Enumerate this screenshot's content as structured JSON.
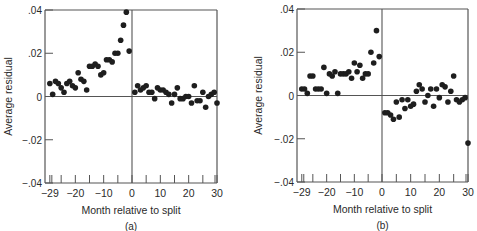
{
  "figure": {
    "panels": [
      {
        "label": "(a)"
      },
      {
        "label": "(b)"
      }
    ]
  },
  "chart_data": [
    {
      "type": "scatter",
      "panel_label": "(a)",
      "title": "",
      "xlabel": "Month relative to split",
      "ylabel": "Average residual",
      "xlim": [
        -30,
        30
      ],
      "ylim": [
        -0.04,
        0.04
      ],
      "xticks": [
        -29,
        -20,
        -10,
        0,
        10,
        20,
        30
      ],
      "xtick_labels": [
        "−29",
        "−20",
        "−10",
        "0",
        "10",
        "20",
        "30"
      ],
      "yticks": [
        0.04,
        0.02,
        0,
        -0.02,
        -0.04
      ],
      "ytick_labels": [
        ".04",
        ".02",
        "0",
        "−.02",
        "−.04"
      ],
      "minor_xticks_every": 5,
      "grid": false,
      "reference_lines": {
        "x": 0,
        "y": 0
      },
      "x": [
        -29,
        -28,
        -27,
        -26,
        -25,
        -24,
        -23,
        -22,
        -21,
        -20,
        -19,
        -18,
        -17,
        -16,
        -15,
        -14,
        -13,
        -12,
        -11,
        -10,
        -9,
        -8,
        -7,
        -6,
        -5,
        -4,
        -3,
        -2,
        -1,
        1,
        2,
        3,
        4,
        5,
        6,
        7,
        8,
        9,
        10,
        11,
        12,
        13,
        14,
        15,
        16,
        17,
        18,
        19,
        20,
        21,
        22,
        23,
        24,
        25,
        26,
        27,
        28,
        29,
        30
      ],
      "values": [
        0.006,
        0.001,
        0.007,
        0.006,
        0.004,
        0.002,
        0.006,
        0.007,
        0.005,
        0.004,
        0.011,
        0.008,
        0.007,
        0.003,
        0.014,
        0.014,
        0.015,
        0.014,
        0.01,
        0.011,
        0.017,
        0.017,
        0.016,
        0.02,
        0.02,
        0.026,
        0.033,
        0.039,
        0.021,
        0.002,
        0.005,
        0.003,
        0.004,
        0.005,
        0.002,
        0.002,
        -0.001,
        0.004,
        0.003,
        0.003,
        0.002,
        0.001,
        -0.003,
        0.001,
        0.004,
        -0.001,
        -0.001,
        0.0,
        0.0,
        -0.003,
        0.005,
        -0.002,
        -0.002,
        0.002,
        -0.005,
        0.0,
        0.001,
        0.002,
        -0.003
      ]
    },
    {
      "type": "scatter",
      "panel_label": "(b)",
      "title": "",
      "xlabel": "Month relative to split",
      "ylabel": "Average residual",
      "xlim": [
        -30,
        30
      ],
      "ylim": [
        -0.04,
        0.04
      ],
      "xticks": [
        -29,
        -20,
        -10,
        0,
        10,
        20,
        30
      ],
      "xtick_labels": [
        "−29",
        "−20",
        "−10",
        "0",
        "10",
        "20",
        "30"
      ],
      "yticks": [
        0.04,
        0.02,
        0,
        -0.02,
        -0.04
      ],
      "ytick_labels": [
        ".04",
        ".02",
        "0",
        "−.02",
        "−.04"
      ],
      "minor_xticks_every": 5,
      "grid": false,
      "reference_lines": {
        "x": 0,
        "y": 0
      },
      "x": [
        -29,
        -28,
        -27,
        -26,
        -25,
        -24,
        -23,
        -22,
        -21,
        -20,
        -19,
        -18,
        -17,
        -16,
        -15,
        -14,
        -13,
        -12,
        -11,
        -10,
        -9,
        -8,
        -7,
        -6,
        -5,
        -4,
        -3,
        -2,
        -1,
        1,
        2,
        3,
        4,
        5,
        6,
        7,
        8,
        9,
        10,
        11,
        12,
        13,
        14,
        15,
        16,
        17,
        18,
        19,
        20,
        21,
        22,
        23,
        24,
        25,
        26,
        27,
        28,
        29,
        30
      ],
      "values": [
        0.003,
        0.003,
        0.001,
        0.009,
        0.009,
        0.003,
        0.003,
        0.003,
        0.013,
        0.001,
        0.01,
        0.009,
        0.011,
        0.001,
        0.01,
        0.01,
        0.01,
        0.011,
        0.008,
        0.015,
        0.011,
        0.014,
        0.008,
        0.01,
        0.01,
        0.02,
        0.015,
        0.03,
        0.018,
        -0.008,
        -0.008,
        -0.009,
        -0.011,
        -0.003,
        -0.01,
        -0.002,
        -0.006,
        -0.002,
        -0.005,
        -0.004,
        0.002,
        0.005,
        0.003,
        -0.003,
        0.0,
        0.003,
        -0.005,
        0.003,
        -0.001,
        0.005,
        0.004,
        -0.003,
        0.002,
        0.009,
        -0.002,
        -0.003,
        -0.002,
        -0.001,
        -0.022
      ],
      "note": "month -1 outlier at about -0.022 occurs just left of zero line"
    }
  ]
}
